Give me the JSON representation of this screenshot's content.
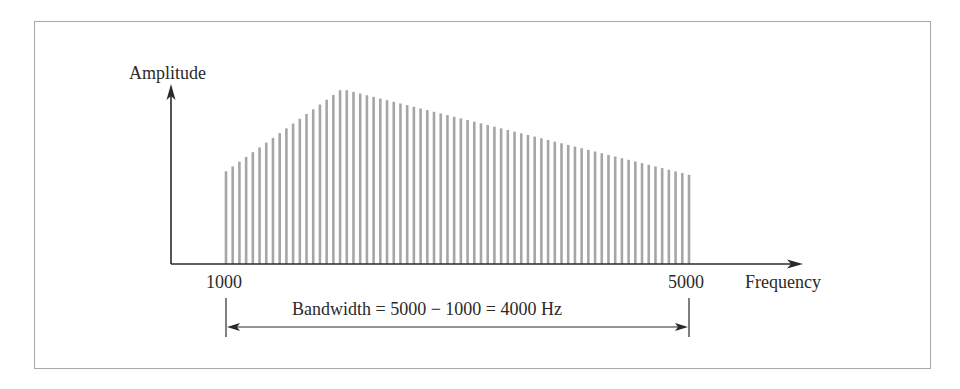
{
  "figure": {
    "y_axis_label": "Amplitude",
    "x_axis_label": "Frequency",
    "x_tick_low": "1000",
    "x_tick_high": "5000",
    "bandwidth_annotation": "Bandwidth = 5000 − 1000 = 4000 Hz",
    "colors": {
      "bars": "#a6a6a6",
      "axes": "#2a2a2a",
      "frame": "#a9a9a9"
    }
  },
  "chart_data": {
    "type": "bar",
    "title": "",
    "xlabel": "Frequency",
    "ylabel": "Amplitude",
    "x_range": [
      1000,
      5000
    ],
    "bandwidth_hz": 4000,
    "shape": "triangular spectrum of discrete components rising from 1000 Hz to a peak near 2000 Hz then falling to 5000 Hz",
    "component_count": 70,
    "relative_amplitude_start": 0.53,
    "relative_amplitude_peak": 1.0,
    "peak_frequency_approx": 2000,
    "relative_amplitude_end": 0.51,
    "legend": [],
    "grid": false
  }
}
